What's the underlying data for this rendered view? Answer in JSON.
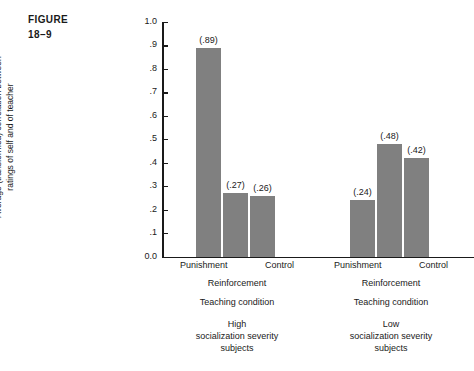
{
  "figure": {
    "label_line1": "FIGURE",
    "label_line2": "18–9"
  },
  "axis": {
    "ytitle_line1": "Average (transformed) correlation between",
    "ytitle_line2": "ratings of self and of teacher",
    "ticks": [
      "1.0",
      ".9",
      ".8",
      ".7",
      ".6",
      ".5",
      ".4",
      ".3",
      ".2",
      ".1",
      "0.0"
    ]
  },
  "groups": [
    {
      "condition_left": "Punishment",
      "condition_right": "Control",
      "reinforcement": "Reinforcement",
      "teaching": "Teaching condition",
      "severity_line1": "High",
      "severity_line2": "socialization severity",
      "severity_line3": "subjects",
      "bars": [
        {
          "label": "(.89)",
          "value": 0.89
        },
        {
          "label": "(.27)",
          "value": 0.27
        },
        {
          "label": "(.26)",
          "value": 0.26
        }
      ]
    },
    {
      "condition_left": "Punishment",
      "condition_right": "Control",
      "reinforcement": "Reinforcement",
      "teaching": "Teaching condition",
      "severity_line1": "Low",
      "severity_line2": "socialization severity",
      "severity_line3": "subjects",
      "bars": [
        {
          "label": "(.24)",
          "value": 0.24
        },
        {
          "label": "(.48)",
          "value": 0.48
        },
        {
          "label": "(.42)",
          "value": 0.42
        }
      ]
    }
  ],
  "colors": {
    "bar_fill": "#808080",
    "axis": "#1a1a1a",
    "background": "#ffffff"
  },
  "chart_data": {
    "type": "bar",
    "title": "FIGURE 18–9",
    "xlabel": "Teaching condition",
    "ylabel": "Average (transformed) correlation between ratings of self and of teacher",
    "ylim": [
      0.0,
      1.0
    ],
    "ytick_labels": [
      "0.0",
      ".1",
      ".2",
      ".3",
      ".4",
      ".5",
      ".6",
      ".7",
      ".8",
      ".9",
      "1.0"
    ],
    "ytick_values": [
      0.0,
      0.1,
      0.2,
      0.3,
      0.4,
      0.5,
      0.6,
      0.7,
      0.8,
      0.9,
      1.0
    ],
    "grid": false,
    "legend": "none",
    "groups": [
      {
        "name": "High socialization severity subjects",
        "categories": [
          "Punishment",
          "Reinforcement",
          "Control"
        ],
        "values": [
          0.89,
          0.27,
          0.26
        ],
        "data_labels": [
          "(.89)",
          "(.27)",
          "(.26)"
        ]
      },
      {
        "name": "Low socialization severity subjects",
        "categories": [
          "Punishment",
          "Reinforcement",
          "Control"
        ],
        "values": [
          0.24,
          0.48,
          0.42
        ],
        "data_labels": [
          "(.24)",
          "(.48)",
          "(.42)"
        ]
      }
    ]
  }
}
